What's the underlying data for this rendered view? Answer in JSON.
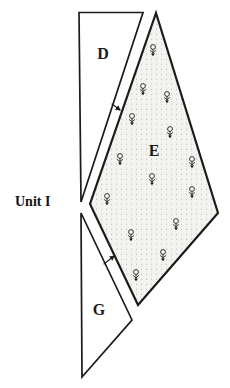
{
  "figure": {
    "unit_label": "Unit I",
    "colors": {
      "background": "#ffffff",
      "ink": "#1b1b1b",
      "stipple_base": "#f4f4f0",
      "stipple_dot": "#d9d9d2",
      "region_fill": "#ffffff"
    },
    "regions": [
      {
        "id": "D",
        "label": "D",
        "points": "79,12.5 143,12.5 81,202",
        "fill": "#ffffff",
        "stroke_width": 1.7,
        "label_x": 103,
        "label_y": 59
      },
      {
        "id": "E",
        "label": "E",
        "points": "156,13 218,213 138,305 90,204",
        "fill": "stipple",
        "stroke_width": 2.2,
        "label_x": 154,
        "label_y": 156
      },
      {
        "id": "G",
        "label": "G",
        "points": "81,213 132,320 82,377",
        "fill": "#ffffff",
        "stroke_width": 1.7,
        "label_x": 99,
        "label_y": 315
      }
    ],
    "flower_symbols": {
      "icon_name": "flower-icon",
      "count": 14,
      "positions": [
        {
          "x": 153,
          "y": 47
        },
        {
          "x": 143,
          "y": 86
        },
        {
          "x": 167,
          "y": 94
        },
        {
          "x": 132,
          "y": 116
        },
        {
          "x": 170,
          "y": 129
        },
        {
          "x": 120,
          "y": 156
        },
        {
          "x": 192,
          "y": 159
        },
        {
          "x": 152,
          "y": 176
        },
        {
          "x": 192,
          "y": 189
        },
        {
          "x": 107,
          "y": 196
        },
        {
          "x": 176,
          "y": 221
        },
        {
          "x": 131,
          "y": 232
        },
        {
          "x": 163,
          "y": 252
        },
        {
          "x": 136,
          "y": 272
        }
      ]
    },
    "arrows": [
      {
        "x1": 112,
        "y1": 104,
        "x2": 120,
        "y2": 110,
        "direction": "into-E-down-right"
      },
      {
        "x1": 104,
        "y1": 264,
        "x2": 114,
        "y2": 256,
        "direction": "into-E-up-right"
      }
    ]
  }
}
